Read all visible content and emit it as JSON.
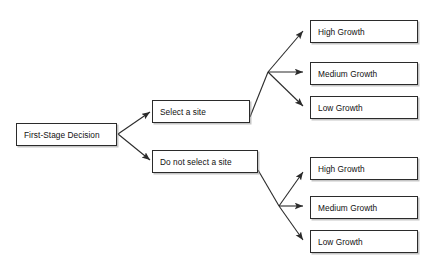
{
  "diagram": {
    "background_color": "#ffffff",
    "line_color": "#2b2b2b",
    "node_border_color": "#2b2b2b",
    "node_fill_color": "#ffffff",
    "text_color": "#111111",
    "root": {
      "label": "First-Stage Decision"
    },
    "decisions": [
      {
        "label": "Select a site"
      },
      {
        "label": "Do not select a site"
      }
    ],
    "outcomes_branch_one": [
      {
        "label": "High Growth"
      },
      {
        "label": "Medium Growth"
      },
      {
        "label": "Low Growth"
      }
    ],
    "outcomes_branch_two": [
      {
        "label": "High Growth"
      },
      {
        "label": "Medium Growth"
      },
      {
        "label": "Low Growth"
      }
    ]
  }
}
